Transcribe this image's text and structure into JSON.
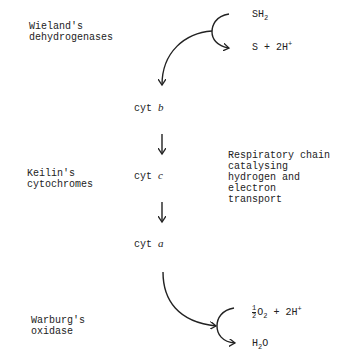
{
  "left_labels": {
    "dehydrogenases": [
      "Wieland's",
      "dehydrogenases"
    ],
    "cytochromes": [
      "Keilin's",
      "cytochromes"
    ],
    "oxidase": [
      "Warburg's",
      "oxidase"
    ]
  },
  "right_label": [
    "Respiratory chain",
    "catalysing",
    "hydrogen and",
    "electron",
    "transport"
  ],
  "substrate": {
    "base": "SH",
    "sub": "2"
  },
  "product_top": {
    "text": "S + 2H",
    "sup": "+"
  },
  "cytochromes": [
    {
      "prefix": "cyt",
      "letter": "b"
    },
    {
      "prefix": "cyt",
      "letter": "c"
    },
    {
      "prefix": "cyt",
      "letter": "a"
    }
  ],
  "oxygen": {
    "frac_num": "1",
    "frac_den": "2",
    "o": "O",
    "o_sub": "2",
    "rest": " + 2H",
    "rest_sup": "+"
  },
  "water": {
    "h": "H",
    "h_sub": "2",
    "o": "O"
  }
}
